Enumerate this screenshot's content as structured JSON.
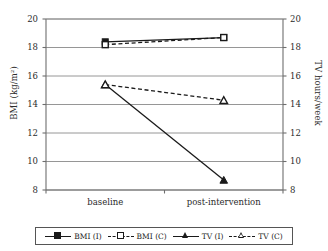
{
  "chart_data": {
    "type": "line",
    "title": "",
    "xlabel": "",
    "categories": [
      "baseline",
      "post-intervention"
    ],
    "grid": true,
    "legend_position": "bottom",
    "axes": {
      "left": {
        "label": "BMI (kg/m²)",
        "ticks": [
          8,
          10,
          12,
          14,
          16,
          18,
          20
        ],
        "tick_labels": [
          "8",
          "10",
          "12",
          "14",
          "16",
          "18",
          "20"
        ],
        "ylim": [
          8,
          20
        ]
      },
      "right": {
        "label": "TV hours/week",
        "ticks": [
          8,
          10,
          12,
          14,
          16,
          18,
          20
        ],
        "tick_labels": [
          "8",
          "10",
          "12",
          "14",
          "16",
          "18",
          "20"
        ],
        "ylim": [
          8,
          20
        ]
      }
    },
    "series": [
      {
        "name": "BMI (I)",
        "axis": "left",
        "linestyle": "solid",
        "marker": "square-filled",
        "color": "#1a1a1a",
        "values": [
          18.4,
          18.7
        ]
      },
      {
        "name": "BMI (C)",
        "axis": "left",
        "linestyle": "dashed",
        "marker": "square-open",
        "color": "#1a1a1a",
        "values": [
          18.2,
          18.7
        ]
      },
      {
        "name": "TV (I)",
        "axis": "right",
        "linestyle": "solid",
        "marker": "triangle-filled",
        "color": "#1a1a1a",
        "values": [
          15.4,
          8.7
        ]
      },
      {
        "name": "TV (C)",
        "axis": "right",
        "linestyle": "dashed",
        "marker": "triangle-open",
        "color": "#1a1a1a",
        "values": [
          15.4,
          14.3
        ]
      }
    ]
  },
  "legend": {
    "items": [
      {
        "label": "BMI (I)",
        "marker": "square-filled",
        "linestyle": "solid"
      },
      {
        "label": "BMI (C)",
        "marker": "square-open",
        "linestyle": "dashed"
      },
      {
        "label": "TV (I)",
        "marker": "triangle-filled",
        "linestyle": "solid"
      },
      {
        "label": "TV (C)",
        "marker": "triangle-open",
        "linestyle": "dashed"
      }
    ]
  },
  "style": {
    "ink": "#1a1a1a",
    "grid_color": "#8a8a8a",
    "axis_color": "#6e6e6e",
    "background": "#ffffff"
  }
}
